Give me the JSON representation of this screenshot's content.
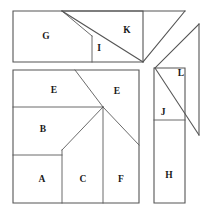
{
  "figure": {
    "kind": "geometric-dissection-diagram",
    "width": 212,
    "height": 215,
    "background_color": "#ffffff",
    "line_color": "#4d4d4d",
    "label_color": "#1a1a1a",
    "piece_count": 12,
    "labels": [
      "A",
      "B",
      "C",
      "E",
      "E",
      "F",
      "G",
      "H",
      "I",
      "J",
      "K",
      "L"
    ]
  },
  "groups": {
    "top_left_rectangle": {
      "name": "top-left-rectangle",
      "bounds": [
        13,
        11,
        143,
        62
      ],
      "pieces": [
        "G",
        "I"
      ]
    },
    "top_right_triangle": {
      "name": "top-right-triangle",
      "pieces": [
        "K"
      ]
    },
    "right_triangle": {
      "name": "right-triangle",
      "pieces": [
        "L"
      ]
    },
    "main_square": {
      "name": "main-square",
      "bounds": [
        13,
        70,
        139,
        203
      ],
      "pieces": [
        "E",
        "E",
        "B",
        "A",
        "C",
        "F"
      ],
      "center_vertex": [
        103,
        107
      ]
    },
    "right_rectangle": {
      "name": "right-rectangle",
      "bounds": [
        154,
        68,
        185,
        203
      ],
      "pieces": [
        "J",
        "H"
      ]
    }
  },
  "pieces": {
    "g": {
      "label": "G",
      "label_x": 46,
      "label_y": 37
    },
    "i": {
      "label": "I",
      "label_x": 99,
      "label_y": 49
    },
    "k": {
      "label": "K",
      "label_x": 127,
      "label_y": 31
    },
    "l": {
      "label": "L",
      "label_x": 181,
      "label_y": 74
    },
    "e_top_left": {
      "label": "E",
      "label_x": 54,
      "label_y": 91
    },
    "e_top_right": {
      "label": "E",
      "label_x": 117,
      "label_y": 92
    },
    "b": {
      "label": "B",
      "label_x": 43,
      "label_y": 130
    },
    "a": {
      "label": "A",
      "label_x": 42,
      "label_y": 180
    },
    "c": {
      "label": "C",
      "label_x": 83,
      "label_y": 180
    },
    "f": {
      "label": "F",
      "label_x": 121,
      "label_y": 180
    },
    "j": {
      "label": "J",
      "label_x": 163,
      "label_y": 113
    },
    "h": {
      "label": "H",
      "label_x": 169,
      "label_y": 176
    }
  }
}
